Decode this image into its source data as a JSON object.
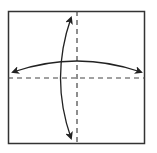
{
  "diagram": {
    "type": "origami-fold-diagram",
    "colors": {
      "paper_fill": "#ffffff",
      "outline": "#333333",
      "fold_line": "#444444",
      "arrow": "#222222"
    },
    "square": {
      "x": 8,
      "y": 11,
      "width": 136,
      "height": 132
    },
    "fold_lines": [
      {
        "orientation": "vertical",
        "style": "dashed",
        "x": 77
      },
      {
        "orientation": "horizontal",
        "style": "dashed",
        "y": 78
      }
    ],
    "arrows": [
      {
        "kind": "double-headed-curved",
        "direction": "vertical",
        "from": [
          71,
          18
        ],
        "to": [
          71,
          138
        ]
      },
      {
        "kind": "double-headed-curved",
        "direction": "horizontal",
        "from": [
          13,
          72
        ],
        "to": [
          141,
          72
        ]
      }
    ]
  }
}
